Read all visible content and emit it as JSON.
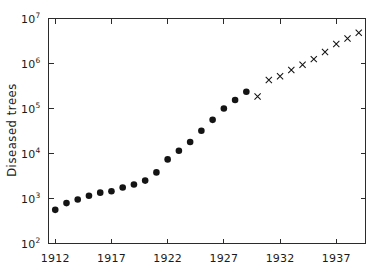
{
  "chart_data": {
    "type": "scatter",
    "title": "",
    "xlabel": "",
    "ylabel": "Diseased trees",
    "yscale": "log",
    "xlim": [
      1911.4,
      1939.6
    ],
    "ylim": [
      100,
      10000000
    ],
    "grid": false,
    "legend_position": "none",
    "x_ticks": [
      1912,
      1917,
      1922,
      1927,
      1932,
      1937
    ],
    "x_tick_labels": [
      "1912",
      "1917",
      "1922",
      "1927",
      "1932",
      "1937"
    ],
    "y_ticks": [
      100,
      1000,
      10000,
      100000,
      1000000,
      10000000
    ],
    "y_tick_labels": [
      "10²",
      "10³",
      "10⁴",
      "10⁵",
      "10⁶",
      "10⁷"
    ],
    "y_tick_mantissa": [
      "10",
      "10",
      "10",
      "10",
      "10",
      "10"
    ],
    "y_tick_exponent": [
      "2",
      "3",
      "4",
      "5",
      "6",
      "7"
    ],
    "series": [
      {
        "name": "observed",
        "marker": "filled-circle",
        "color": "#141414",
        "x": [
          1912,
          1913,
          1914,
          1915,
          1916,
          1917,
          1918,
          1919,
          1920,
          1921,
          1922,
          1923,
          1924,
          1925,
          1926,
          1927,
          1928,
          1929
        ],
        "values": [
          560,
          790,
          950,
          1150,
          1350,
          1450,
          1750,
          2050,
          2500,
          3800,
          7400,
          11500,
          18000,
          32000,
          56000,
          100000,
          155000,
          235000
        ]
      },
      {
        "name": "projected",
        "marker": "cross",
        "color": "#141414",
        "x": [
          1930,
          1931,
          1932,
          1933,
          1934,
          1935,
          1936,
          1937,
          1938,
          1939
        ],
        "values": [
          185000,
          430000,
          520000,
          720000,
          940000,
          1250000,
          1800000,
          2700000,
          3600000,
          4800000
        ]
      }
    ]
  }
}
